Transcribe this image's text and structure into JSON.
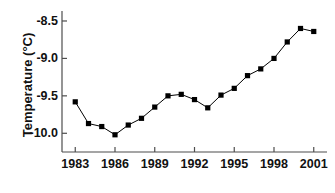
{
  "chart_data": {
    "type": "line",
    "title": "",
    "xlabel": "",
    "ylabel": "Temperature (°C)",
    "x": [
      1983,
      1984,
      1985,
      1986,
      1987,
      1988,
      1989,
      1990,
      1991,
      1992,
      1993,
      1994,
      1995,
      1996,
      1997,
      1998,
      1999,
      2000,
      2001
    ],
    "values": [
      -9.58,
      -9.87,
      -9.91,
      -10.02,
      -9.89,
      -9.8,
      -9.65,
      -9.5,
      -9.48,
      -9.55,
      -9.66,
      -9.49,
      -9.4,
      -9.23,
      -9.14,
      -9.0,
      -8.78,
      -8.6,
      -8.64
    ],
    "series": [
      {
        "name": "Temperature",
        "values": [
          -9.58,
          -9.87,
          -9.91,
          -10.02,
          -9.89,
          -9.8,
          -9.65,
          -9.5,
          -9.48,
          -9.55,
          -9.66,
          -9.49,
          -9.4,
          -9.23,
          -9.14,
          -9.0,
          -8.78,
          -8.6,
          -8.64
        ]
      }
    ],
    "xlim": [
      1982.0,
      2002.0
    ],
    "ylim": [
      -10.25,
      -8.38
    ],
    "xticks": [
      1983,
      1986,
      1989,
      1992,
      1995,
      1998,
      2001
    ],
    "xtick_labels": [
      "1983",
      "1986",
      "1989",
      "1992",
      "1995",
      "1998",
      "2001"
    ],
    "yticks": [
      -10.0,
      -9.5,
      -9.0,
      -8.5
    ],
    "ytick_labels": [
      "-10.0",
      "-9.5",
      "-9.0",
      "-8.5"
    ],
    "grid": false,
    "legend": null,
    "marker": "square",
    "marker_color": "#000000",
    "line_color": "#000000",
    "axis_color": "#4d4d4d",
    "background": "#ffffff"
  },
  "axes": {
    "y_axis_name": "y-axis",
    "x_axis_name": "x-axis"
  }
}
